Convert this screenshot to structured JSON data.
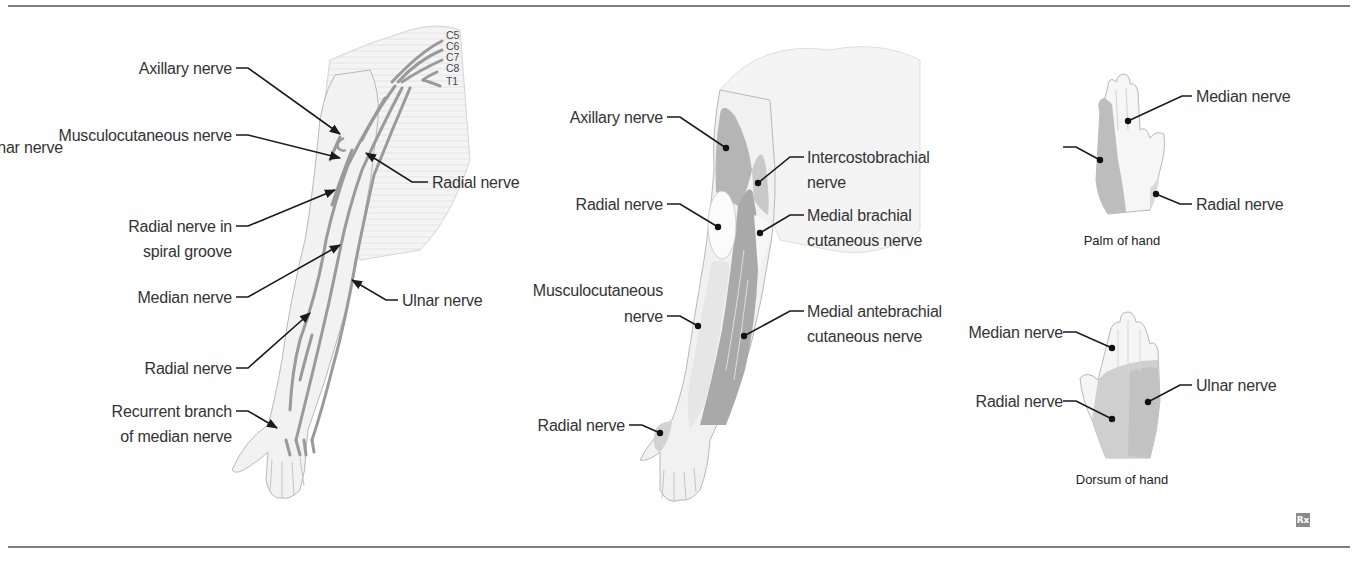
{
  "colors": {
    "rule": "#555555",
    "skin_fill": "#f1f1f1",
    "skin_outline": "#b5b5b5",
    "nerve": "#9a9a9a",
    "shade_dark": "#a9a9a9",
    "shade_mid": "#c6c6c6",
    "shade_light": "#dcdcdc",
    "label_text": "#333333",
    "leader": "#1a1a1a"
  },
  "panel_left": {
    "title": "Brachial plexus nerves of the upper limb",
    "roots": [
      "C5",
      "C6",
      "C7",
      "C8",
      "T1"
    ],
    "labels_left": [
      {
        "lines": [
          "Axillary nerve"
        ]
      },
      {
        "lines": [
          "Musculocutaneous nerve"
        ]
      },
      {
        "lines": [
          "Radial nerve in",
          "spiral groove"
        ]
      },
      {
        "lines": [
          "Median nerve"
        ]
      },
      {
        "lines": [
          "Radial nerve"
        ]
      },
      {
        "lines": [
          "Recurrent branch",
          "of median nerve"
        ]
      }
    ],
    "labels_right": [
      {
        "lines": [
          "Radial nerve"
        ]
      },
      {
        "lines": [
          "Ulnar nerve"
        ]
      }
    ]
  },
  "panel_middle": {
    "title": "Cutaneous innervation of the arm",
    "labels_left": [
      {
        "lines": [
          "Axillary nerve"
        ]
      },
      {
        "lines": [
          "Radial nerve"
        ]
      },
      {
        "lines": [
          "Musculocutaneous",
          "nerve"
        ]
      },
      {
        "lines": [
          "Radial nerve"
        ]
      }
    ],
    "labels_right": [
      {
        "lines": [
          "Intercostobrachial",
          "nerve"
        ]
      },
      {
        "lines": [
          "Medial brachial",
          "cutaneous nerve"
        ]
      },
      {
        "lines": [
          "Medial antebrachial",
          "cutaneous nerve"
        ]
      }
    ]
  },
  "panel_palm": {
    "caption": "Palm of hand",
    "labels": {
      "median": "Median nerve",
      "ulnar": "Ulnar nerve",
      "radial": "Radial nerve"
    }
  },
  "panel_dorsum": {
    "caption": "Dorsum of hand",
    "labels": {
      "median": "Median nerve",
      "radial": "Radial nerve",
      "ulnar": "Ulnar nerve"
    }
  },
  "badge": {
    "icon": "rx-icon",
    "text": "Rx"
  }
}
